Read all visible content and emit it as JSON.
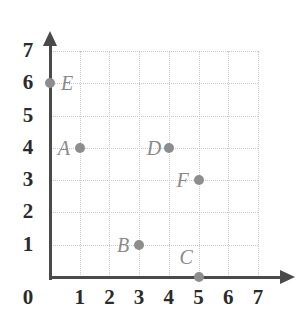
{
  "chart_data": {
    "type": "scatter",
    "title": "",
    "xlabel": "",
    "ylabel": "",
    "xlim": [
      0,
      7
    ],
    "ylim": [
      0,
      7
    ],
    "grid": true,
    "legend": "none",
    "x_ticks": [
      "0",
      "1",
      "2",
      "3",
      "4",
      "5",
      "6",
      "7"
    ],
    "y_ticks": [
      "1",
      "2",
      "3",
      "4",
      "5",
      "6",
      "7"
    ],
    "x_tick_values": [
      0,
      1,
      2,
      3,
      4,
      5,
      6,
      7
    ],
    "y_tick_values": [
      1,
      2,
      3,
      4,
      5,
      6,
      7
    ],
    "origin_label": "0",
    "points": [
      {
        "label": "A",
        "x": 1,
        "y": 4,
        "label_pos": "left"
      },
      {
        "label": "B",
        "x": 3,
        "y": 1,
        "label_pos": "left"
      },
      {
        "label": "C",
        "x": 5,
        "y": 0,
        "label_pos": "above-left"
      },
      {
        "label": "D",
        "x": 4,
        "y": 4,
        "label_pos": "left"
      },
      {
        "label": "E",
        "x": 0,
        "y": 6,
        "label_pos": "right"
      },
      {
        "label": "F",
        "x": 5,
        "y": 3,
        "label_pos": "left"
      }
    ],
    "colors": {
      "point": "#8d8d8d",
      "point_label": "#8a8a8a",
      "axis": "#4a4a4a",
      "tick_label": "#2b2b2b",
      "grid": "#c9c9c9",
      "background": "#ffffff"
    }
  }
}
